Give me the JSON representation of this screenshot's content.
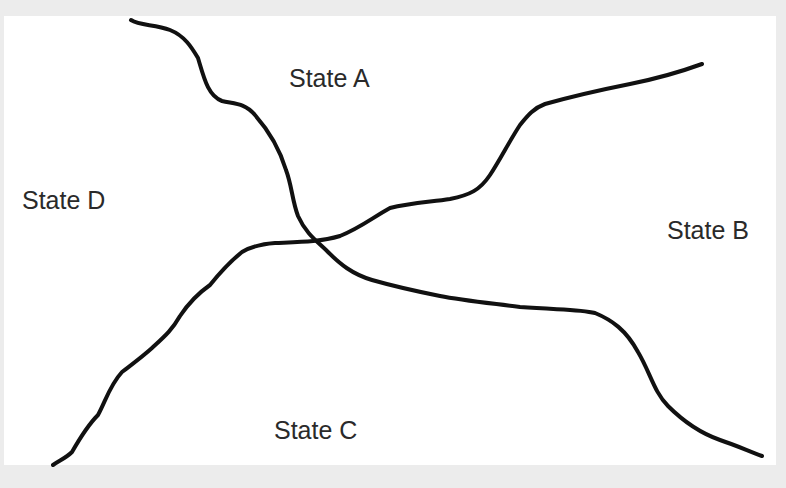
{
  "diagram": {
    "type": "state-region-map",
    "regions": [
      {
        "id": "A",
        "label": "State A",
        "position": "top"
      },
      {
        "id": "B",
        "label": "State B",
        "position": "right"
      },
      {
        "id": "C",
        "label": "State C",
        "position": "bottom"
      },
      {
        "id": "D",
        "label": "State D",
        "position": "left"
      }
    ],
    "boundaries": [
      {
        "name": "boundary-curve-1",
        "from": "top-left",
        "to": "bottom-right",
        "separates": [
          "A|D",
          "B|C"
        ]
      },
      {
        "name": "boundary-curve-2",
        "from": "bottom-left",
        "to": "top-right",
        "separates": [
          "C|D",
          "A|B"
        ]
      }
    ],
    "colors": {
      "background": "#ffffff",
      "border": "#ececec",
      "line": "#111111",
      "text": "#2a2a2a"
    }
  }
}
